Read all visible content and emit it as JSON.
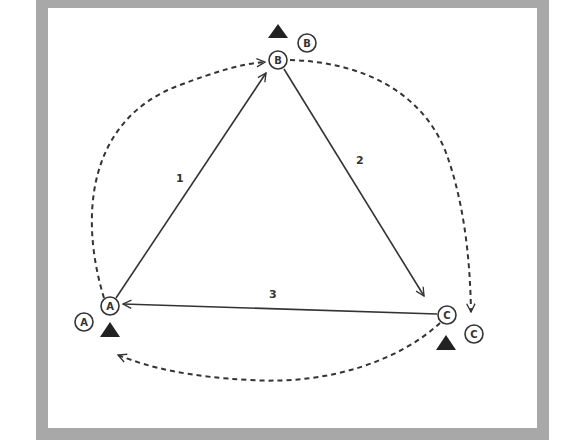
{
  "diagram": {
    "type": "passing-drill-triangle",
    "colors": {
      "frame": "#a8a8a8",
      "line": "#333333",
      "background": "#ffffff"
    },
    "stations": [
      {
        "id": "A",
        "player_label": "A",
        "waiting_label": "A"
      },
      {
        "id": "B",
        "player_label": "B",
        "waiting_label": "B"
      },
      {
        "id": "C",
        "player_label": "C",
        "waiting_label": "C"
      }
    ],
    "passes": [
      {
        "label": "1",
        "from": "A",
        "to": "B"
      },
      {
        "label": "2",
        "from": "B",
        "to": "C"
      },
      {
        "label": "3",
        "from": "C",
        "to": "A"
      }
    ],
    "runs": [
      {
        "from": "A",
        "to": "B",
        "style": "dashed"
      },
      {
        "from": "B",
        "to": "C",
        "style": "dashed"
      },
      {
        "from": "C",
        "to": "A",
        "style": "dashed"
      }
    ]
  }
}
